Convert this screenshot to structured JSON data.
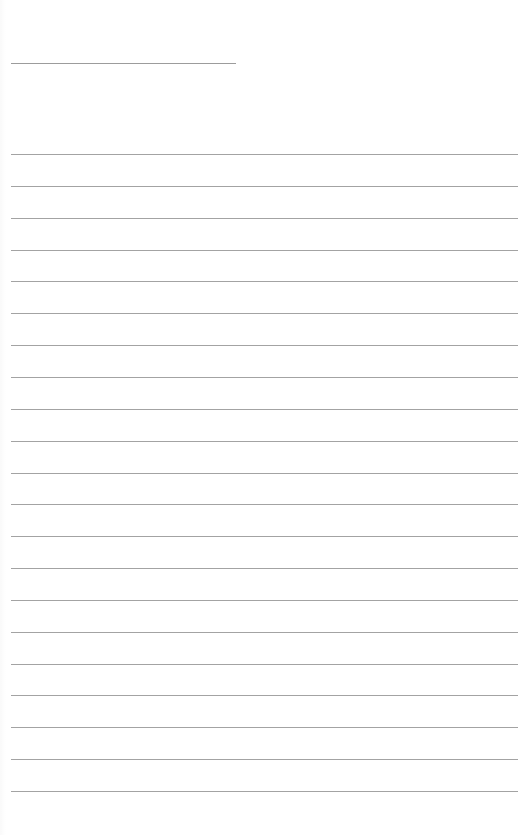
{
  "page": {
    "type": "lined-writing-sheet",
    "background_color": "#ffffff",
    "line_color": "#a3a3a3",
    "title_line": {
      "x": 11,
      "y": 63,
      "width": 225
    },
    "ruled_lines": {
      "count": 21,
      "first_y": 154,
      "spacing": 31.85,
      "x": 11,
      "width": 507
    }
  }
}
